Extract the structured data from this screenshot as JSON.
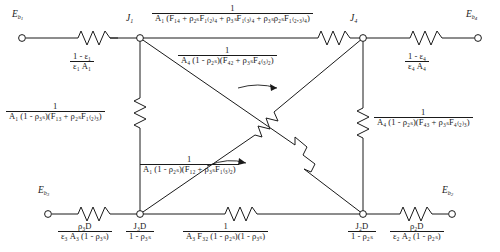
{
  "diagram": {
    "type": "resistance-network",
    "line_color": "#1a1a1a",
    "background": "#ffffff"
  },
  "terminals": [
    {
      "id": "Eb1",
      "label_html": "<i>E</i><sub><i>b</i><sub>1</sub></sub>",
      "x": 22,
      "y": 38,
      "text_x": 14,
      "text_y": 18
    },
    {
      "id": "Eb4",
      "label_html": "<i>E</i><sub><i>b</i><sub>4</sub></sub>",
      "x": 478,
      "y": 38,
      "text_x": 466,
      "text_y": 18
    },
    {
      "id": "Eb3",
      "label_html": "<i>E</i><sub><i>b</i><sub>3</sub></sub>",
      "x": 48,
      "y": 214,
      "text_x": 40,
      "text_y": 194
    },
    {
      "id": "Eb2",
      "label_html": "<i>E</i><sub><i>b</i><sub>2</sub></sub>",
      "x": 452,
      "y": 214,
      "text_x": 440,
      "text_y": 194
    }
  ],
  "nodes": [
    {
      "id": "J1",
      "label_html": "<i>J</i><sub>1</sub>",
      "x": 140,
      "y": 38,
      "text_x": 124,
      "text_y": 18
    },
    {
      "id": "J4",
      "label_html": "<i>J</i><sub>4</sub>",
      "x": 363,
      "y": 38,
      "text_x": 352,
      "text_y": 18
    },
    {
      "id": "J3D",
      "label_html": "J3D",
      "x": 140,
      "y": 214,
      "text_x": 126,
      "text_y": 220
    },
    {
      "id": "J2D",
      "label_html": "J2D",
      "x": 363,
      "y": 214,
      "text_x": 348,
      "text_y": 220
    }
  ],
  "resistors": {
    "top_left": {
      "name": "surface-resistance-1",
      "numerator": "1 - ε₁",
      "denominator": "ε₁ A₁"
    },
    "top_right": {
      "name": "surface-resistance-4",
      "numerator": "1 - ε₄",
      "denominator": "ε₄ A₄"
    },
    "bottom_left": {
      "name": "surface-resistance-3D",
      "numerator": "ρ₃D",
      "denominator": "ε₃ A₃ (1 - ρ₃ₛ)"
    },
    "bottom_right": {
      "name": "surface-resistance-2D",
      "numerator": "ρ₂D",
      "denominator": "ε₂ A₂ (1 - ρ₂ₛ)"
    },
    "top_center": {
      "name": "space-resistance-1-4",
      "numerator": "1",
      "denominator": "A₁ (F₁₄ + ρ₂ₛF₁₍₂₎₄ + ρ₃ₛF₁₍₃₎₄ + ρ₃ₛρ₂ₛF₁₍₂,₃₎₄)"
    },
    "diag_1_2": {
      "name": "space-resistance-1-2",
      "numerator": "1",
      "denominator": "A₁ (1 - ρ₂ₛ)(F₁₂ + ρ₃ₛF₁₍₃₎₂)"
    },
    "diag_4_2": {
      "name": "space-resistance-4-2",
      "numerator": "1",
      "denominator": "A₄ (1 - ρ₂ₛ)(F₄₂ + ρ₃ₛF₄₍₃₎₂)"
    },
    "left_vert": {
      "name": "space-resistance-1-3",
      "numerator": "1",
      "denominator": "A₁ (1 - ρ₃ₛ)(F₁₃ + ρ₂ₛF₁₍₂₎₃)"
    },
    "right_vert": {
      "name": "space-resistance-4-3",
      "numerator": "1",
      "denominator": "A₄ (1 - ρ₂ₛ)(F₄₃ + ρ₃ₛF₄₍₂₎₃)"
    },
    "bottom_center": {
      "name": "space-resistance-3-2",
      "numerator": "1",
      "denominator": "A₃ F₃₂ (1 - ρ₂ₛ)(1 - ρ₃ₛ)"
    }
  },
  "node_labels": {
    "J3D": {
      "numerator": "J₃D",
      "denominator": "1 - ρ₃ₛ"
    },
    "J2D": {
      "numerator": "J₂D",
      "denominator": "1 - ρ₂ₛ"
    }
  }
}
